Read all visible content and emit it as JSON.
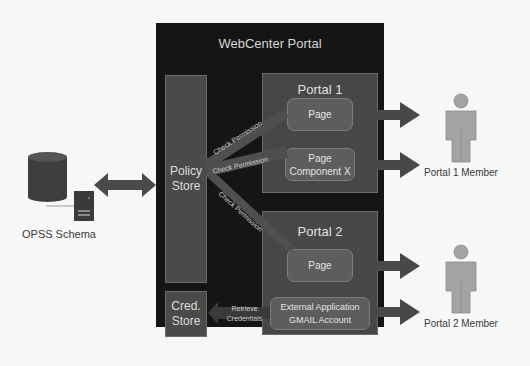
{
  "diagram": {
    "container": {
      "title": "WebCenter Portal"
    },
    "policy_store": {
      "label": "Policy Store"
    },
    "cred_store": {
      "label": "Cred. Store"
    },
    "portal1": {
      "title": "Portal 1",
      "items": [
        {
          "label": "Page"
        },
        {
          "label": "Page Component X"
        }
      ],
      "member_label": "Portal 1 Member"
    },
    "portal2": {
      "title": "Portal 2",
      "items": [
        {
          "label": "Page"
        },
        {
          "label": "External Application GMAIL Account"
        }
      ],
      "member_label": "Portal 2 Member"
    },
    "opss": {
      "label": "OPSS Schema"
    },
    "edges": {
      "check_permission_1": "Check Permission",
      "check_permission_2": "Check Permission",
      "check_permission_3": "Check Permission",
      "retrieve_credentials": "Retrieve Credentials"
    },
    "colors": {
      "container": "#151515",
      "store": "#4a4a4a",
      "portal": "#474747",
      "box": "#5d5d5d",
      "arrow": "#474747",
      "person": "#a3a3a3"
    }
  }
}
